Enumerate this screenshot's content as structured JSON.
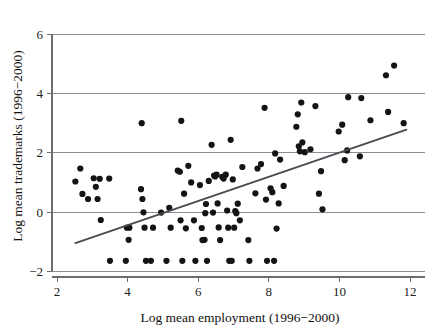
{
  "figure": {
    "background_color": "#ffffff",
    "point_color": "#141414",
    "line_color": "#4a4a52",
    "grid_color": "#8e8e92"
  },
  "chart_data": {
    "type": "scatter",
    "title": "",
    "subtitle": "",
    "xlabel": "Log mean employment (1996−2000)",
    "ylabel": "Log mean trademarks (1996−2000)",
    "xlim": [
      1.55,
      12.45
    ],
    "ylim": [
      -2.35,
      6.3
    ],
    "xticks": [
      2,
      4,
      6,
      8,
      10,
      12
    ],
    "xtick_labels": [
      "2",
      "4",
      "6",
      "8",
      "10",
      "12"
    ],
    "yticks": [
      -2,
      0,
      2,
      4,
      6
    ],
    "ytick_labels": [
      "−2",
      "0",
      "2",
      "4",
      "6"
    ],
    "grid": "horizontal",
    "legend": "none",
    "annotations": [],
    "marker": "filled-circle",
    "marker_size_px": 3.1,
    "series": [
      {
        "name": "firms",
        "type": "scatter",
        "points": [
          [
            2.52,
            1.03
          ],
          [
            2.66,
            1.47
          ],
          [
            2.72,
            0.61
          ],
          [
            2.88,
            0.44
          ],
          [
            3.04,
            1.14
          ],
          [
            3.1,
            0.85
          ],
          [
            3.15,
            0.44
          ],
          [
            3.21,
            1.12
          ],
          [
            3.24,
            -0.27
          ],
          [
            3.48,
            1.13
          ],
          [
            3.5,
            -1.65
          ],
          [
            3.95,
            -1.65
          ],
          [
            3.98,
            -0.53
          ],
          [
            4.05,
            -0.53
          ],
          [
            4.03,
            -0.94
          ],
          [
            4.38,
            0.77
          ],
          [
            4.4,
            3.0
          ],
          [
            4.42,
            0.44
          ],
          [
            4.45,
            -0.01
          ],
          [
            4.48,
            -0.53
          ],
          [
            4.52,
            -1.65
          ],
          [
            4.66,
            -1.65
          ],
          [
            4.72,
            -0.53
          ],
          [
            4.95,
            -0.02
          ],
          [
            5.1,
            -1.65
          ],
          [
            5.18,
            0.14
          ],
          [
            5.22,
            -0.53
          ],
          [
            5.42,
            1.4
          ],
          [
            5.48,
            1.36
          ],
          [
            5.5,
            -0.28
          ],
          [
            5.52,
            3.08
          ],
          [
            5.55,
            -1.65
          ],
          [
            5.6,
            0.62
          ],
          [
            5.65,
            -0.55
          ],
          [
            5.72,
            1.56
          ],
          [
            5.8,
            1.0
          ],
          [
            5.88,
            -0.28
          ],
          [
            5.92,
            -1.65
          ],
          [
            6.05,
            0.91
          ],
          [
            6.1,
            -0.54
          ],
          [
            6.12,
            -0.95
          ],
          [
            6.18,
            -0.94
          ],
          [
            6.2,
            -0.04
          ],
          [
            6.22,
            0.27
          ],
          [
            6.25,
            -1.65
          ],
          [
            6.3,
            1.05
          ],
          [
            6.38,
            2.27
          ],
          [
            6.42,
            -0.02
          ],
          [
            6.45,
            1.23
          ],
          [
            6.48,
            1.2
          ],
          [
            6.52,
            1.26
          ],
          [
            6.55,
            0.29
          ],
          [
            6.58,
            -0.52
          ],
          [
            6.62,
            -0.95
          ],
          [
            6.68,
            1.19
          ],
          [
            6.72,
            1.13
          ],
          [
            6.78,
            1.26
          ],
          [
            6.82,
            0.05
          ],
          [
            6.85,
            -0.53
          ],
          [
            6.88,
            -1.65
          ],
          [
            6.92,
            2.44
          ],
          [
            6.95,
            -1.65
          ],
          [
            6.98,
            1.1
          ],
          [
            7.02,
            -0.53
          ],
          [
            7.05,
            0.03
          ],
          [
            7.08,
            -0.04
          ],
          [
            7.12,
            0.28
          ],
          [
            7.18,
            -0.28
          ],
          [
            7.25,
            1.52
          ],
          [
            7.42,
            -0.95
          ],
          [
            7.45,
            -1.65
          ],
          [
            7.62,
            0.63
          ],
          [
            7.68,
            1.47
          ],
          [
            7.78,
            1.62
          ],
          [
            7.88,
            3.52
          ],
          [
            7.92,
            0.42
          ],
          [
            7.95,
            -1.65
          ],
          [
            8.05,
            0.8
          ],
          [
            8.1,
            0.67
          ],
          [
            8.15,
            -1.65
          ],
          [
            8.18,
            1.98
          ],
          [
            8.22,
            -0.56
          ],
          [
            8.28,
            0.29
          ],
          [
            8.32,
            1.77
          ],
          [
            8.42,
            0.88
          ],
          [
            8.78,
            2.88
          ],
          [
            8.82,
            3.3
          ],
          [
            8.85,
            2.22
          ],
          [
            8.88,
            2.05
          ],
          [
            8.92,
            3.7
          ],
          [
            8.95,
            2.35
          ],
          [
            9.02,
            2.02
          ],
          [
            9.18,
            2.12
          ],
          [
            9.32,
            3.58
          ],
          [
            9.42,
            0.62
          ],
          [
            9.48,
            1.38
          ],
          [
            9.52,
            0.09
          ],
          [
            9.98,
            2.72
          ],
          [
            10.08,
            2.95
          ],
          [
            10.15,
            1.75
          ],
          [
            10.22,
            2.08
          ],
          [
            10.25,
            3.88
          ],
          [
            10.58,
            1.88
          ],
          [
            10.62,
            3.85
          ],
          [
            10.88,
            3.1
          ],
          [
            11.32,
            4.62
          ],
          [
            11.38,
            3.38
          ],
          [
            11.55,
            4.95
          ],
          [
            11.82,
            3.0
          ]
        ]
      }
    ],
    "fit_line": {
      "name": "regression-line",
      "type": "line",
      "x_start": 2.52,
      "y_start": -1.05,
      "x_end": 11.9,
      "y_end": 2.78
    }
  }
}
